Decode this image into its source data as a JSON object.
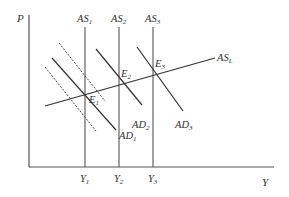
{
  "diagram": {
    "type": "AD-AS macroeconomic diagram",
    "axes": {
      "y_label": "P",
      "x_label": "Y"
    },
    "as_curves": [
      {
        "id": "AS1",
        "base": "AS",
        "sub": "1",
        "x": 85
      },
      {
        "id": "AS2",
        "base": "AS",
        "sub": "2",
        "x": 119
      },
      {
        "id": "AS3",
        "base": "AS",
        "sub": "3",
        "x": 153
      }
    ],
    "long_run": {
      "id": "ASL",
      "base": "AS",
      "sub": "L"
    },
    "ad_curves": [
      {
        "id": "AD1",
        "base": "AD",
        "sub": "1"
      },
      {
        "id": "AD2",
        "base": "AD",
        "sub": "2"
      },
      {
        "id": "AD3",
        "base": "AD",
        "sub": "3"
      }
    ],
    "equilibria": [
      {
        "id": "E1",
        "base": "E",
        "sub": "1"
      },
      {
        "id": "E2",
        "base": "E",
        "sub": "2"
      },
      {
        "id": "E3",
        "base": "E",
        "sub": "3"
      }
    ],
    "outputs": [
      {
        "id": "Y1",
        "base": "Y",
        "sub": "1"
      },
      {
        "id": "Y2",
        "base": "Y",
        "sub": "2"
      },
      {
        "id": "Y3",
        "base": "Y",
        "sub": "3"
      }
    ],
    "colors": {
      "line": "#333333",
      "background": "#ffffff"
    }
  }
}
